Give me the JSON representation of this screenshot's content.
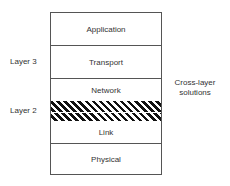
{
  "diagram": {
    "layers": [
      {
        "label": "Application"
      },
      {
        "label": "Transport"
      },
      {
        "label": "Network"
      },
      {
        "label": "Link"
      },
      {
        "label": "Physical"
      }
    ],
    "side_labels": {
      "layer3": "Layer 3",
      "layer2": "Layer 2"
    },
    "cross_layer": {
      "line1": "Cross-layer",
      "line2": "solutions"
    }
  }
}
